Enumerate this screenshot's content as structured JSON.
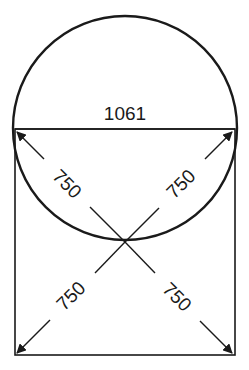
{
  "diagram": {
    "title_label": "1061",
    "dimensions": {
      "chord": "1061",
      "upper_left": "750",
      "upper_right": "750",
      "lower_left": "750",
      "lower_right": "750"
    },
    "colors": {
      "stroke": "#1a1a1a",
      "background": "#ffffff"
    },
    "shapes": {
      "circle": {
        "cx": 125,
        "cy": 128,
        "r": 113
      },
      "rectangle": {
        "x": 15,
        "y": 129,
        "width": 220,
        "height": 226
      },
      "chord_y": 129,
      "intersection": {
        "x": 125,
        "y": 242
      }
    }
  }
}
